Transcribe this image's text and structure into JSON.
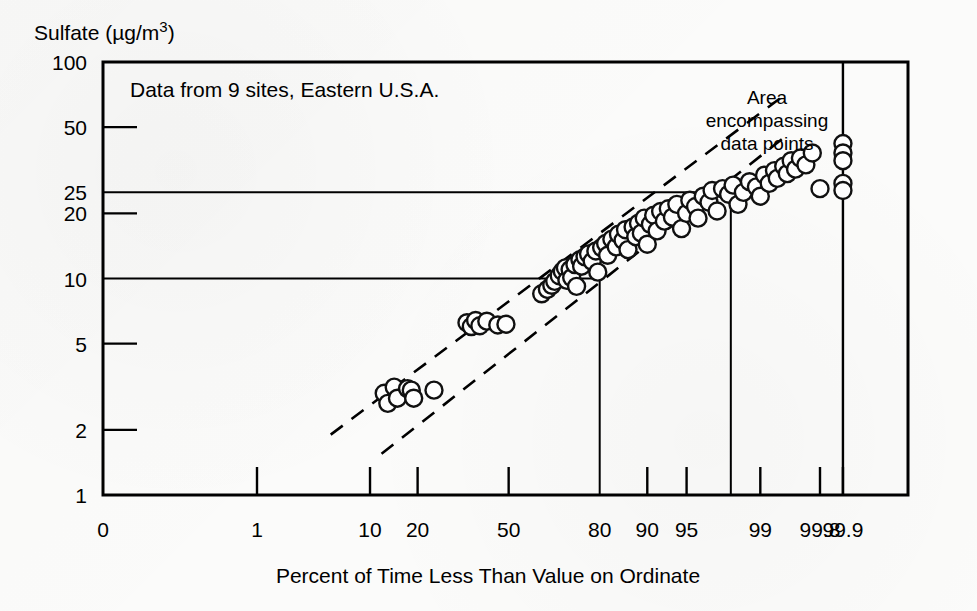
{
  "chart_data": {
    "type": "scatter",
    "title": "",
    "note": "Data from 9 sites, Eastern U.S.A.",
    "annotation": "Area\nencompassing\ndata points",
    "annotation_lines": [
      "Area",
      "encompassing",
      "data points"
    ],
    "ylabel": "Sulfate (µg/m³)",
    "ylabel_parts": {
      "main": "Sulfate (",
      "mu": "µ",
      "unit": "g/m",
      "sup": "3",
      "close": ")"
    },
    "xlabel": "Percent of Time Less Than Value on Ordinate",
    "yscale": "log",
    "ylim": [
      1,
      100
    ],
    "yticks": [
      100,
      50,
      25,
      20,
      10,
      5,
      2,
      1
    ],
    "ytick_labels": [
      "100",
      "50",
      "25",
      "20",
      "10",
      "5",
      "2",
      "1"
    ],
    "xscale": "probability",
    "xlim": [
      0,
      99.9
    ],
    "xticks": [
      0,
      1,
      10,
      20,
      50,
      80,
      90,
      95,
      99,
      99.8,
      99.9
    ],
    "xtick_labels": [
      "0",
      "1",
      "10",
      "20",
      "50",
      "80",
      "90",
      "95",
      "99",
      "99.8",
      "99.9"
    ],
    "grid": false,
    "legend": "none",
    "reference_lines": [
      {
        "name": "horizontal-25",
        "orientation": "horizontal",
        "y": 25,
        "x_from": 0,
        "x_to": 98
      },
      {
        "name": "horizontal-10",
        "orientation": "horizontal",
        "y": 10,
        "x_from": 0,
        "x_to": 80
      },
      {
        "name": "vertical-80",
        "orientation": "vertical",
        "x": 80,
        "y_from": 1,
        "y_to": 10
      },
      {
        "name": "vertical-98",
        "orientation": "vertical",
        "x": 98,
        "y_from": 1,
        "y_to": 25
      }
    ],
    "envelope_upper": {
      "x": [
        5,
        99.5
      ],
      "y": [
        1.9,
        72
      ]
    },
    "envelope_lower": {
      "x": [
        12,
        99.5
      ],
      "y": [
        1.55,
        46
      ]
    },
    "series": [
      {
        "name": "Sulfate concentration percentiles",
        "marker": "open-circle",
        "points": [
          [
            12.5,
            2.95
          ],
          [
            13.2,
            2.65
          ],
          [
            14.5,
            3.15
          ],
          [
            15.2,
            2.8
          ],
          [
            17.5,
            3.1
          ],
          [
            18.4,
            3.05
          ],
          [
            19.0,
            2.8
          ],
          [
            24.5,
            3.05
          ],
          [
            35.0,
            6.25
          ],
          [
            36.5,
            6.0
          ],
          [
            38.0,
            6.4
          ],
          [
            39.5,
            6.05
          ],
          [
            42.0,
            6.35
          ],
          [
            46.0,
            6.1
          ],
          [
            49.0,
            6.15
          ],
          [
            62.0,
            8.5
          ],
          [
            64.0,
            8.9
          ],
          [
            65.5,
            9.3
          ],
          [
            66.5,
            9.7
          ],
          [
            68.0,
            10.3
          ],
          [
            69.0,
            10.8
          ],
          [
            70.0,
            11.2
          ],
          [
            70.5,
            9.8
          ],
          [
            71.5,
            11.0
          ],
          [
            72.0,
            10.1
          ],
          [
            73.0,
            11.6
          ],
          [
            73.5,
            9.2
          ],
          [
            74.5,
            12.2
          ],
          [
            75.0,
            11.4
          ],
          [
            76.0,
            12.6
          ],
          [
            77.0,
            13.0
          ],
          [
            78.0,
            12.0
          ],
          [
            79.0,
            13.4
          ],
          [
            79.5,
            10.7
          ],
          [
            80.5,
            13.9
          ],
          [
            81.5,
            14.5
          ],
          [
            82.0,
            12.8
          ],
          [
            83.0,
            15.2
          ],
          [
            84.0,
            14.0
          ],
          [
            84.5,
            16.0
          ],
          [
            85.5,
            15.0
          ],
          [
            86.0,
            16.8
          ],
          [
            86.5,
            13.6
          ],
          [
            87.5,
            17.3
          ],
          [
            88.0,
            15.6
          ],
          [
            88.5,
            18.0
          ],
          [
            89.0,
            16.2
          ],
          [
            89.5,
            19.0
          ],
          [
            90.0,
            14.4
          ],
          [
            90.5,
            17.8
          ],
          [
            91.0,
            19.6
          ],
          [
            91.5,
            16.6
          ],
          [
            92.0,
            20.4
          ],
          [
            92.5,
            18.4
          ],
          [
            93.0,
            21.0
          ],
          [
            93.5,
            19.2
          ],
          [
            94.0,
            22.0
          ],
          [
            94.5,
            17.0
          ],
          [
            95.0,
            20.0
          ],
          [
            95.3,
            23.0
          ],
          [
            95.8,
            21.5
          ],
          [
            96.0,
            19.0
          ],
          [
            96.4,
            24.0
          ],
          [
            96.8,
            22.5
          ],
          [
            97.0,
            25.5
          ],
          [
            97.3,
            20.5
          ],
          [
            97.6,
            26.0
          ],
          [
            97.9,
            24.5
          ],
          [
            98.1,
            27.0
          ],
          [
            98.3,
            22.0
          ],
          [
            98.5,
            25.0
          ],
          [
            98.7,
            28.0
          ],
          [
            98.9,
            26.5
          ],
          [
            99.0,
            24.0
          ],
          [
            99.1,
            30.0
          ],
          [
            99.2,
            27.5
          ],
          [
            99.3,
            31.5
          ],
          [
            99.35,
            29.0
          ],
          [
            99.45,
            33.0
          ],
          [
            99.5,
            30.5
          ],
          [
            99.55,
            35.0
          ],
          [
            99.6,
            32.0
          ],
          [
            99.65,
            36.0
          ],
          [
            99.7,
            33.5
          ],
          [
            99.75,
            38.0
          ],
          [
            99.8,
            26.0
          ],
          [
            99.9,
            42.0
          ],
          [
            99.9,
            38.0
          ],
          [
            99.9,
            35.0
          ],
          [
            99.9,
            27.5
          ],
          [
            99.9,
            25.5
          ]
        ]
      }
    ]
  }
}
